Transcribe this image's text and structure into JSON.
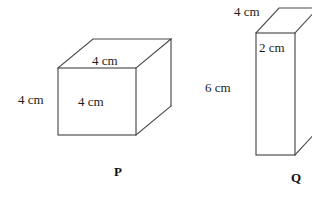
{
  "figure": {
    "background_color": "#ffffff",
    "line_color": "#4a4a4a",
    "text_color": "#1c1c1c",
    "shapes": [
      {
        "name": "P",
        "type": "cube",
        "labels": {
          "top_edge": "4 cm",
          "left_edge": "4 cm",
          "front_face": "4 cm"
        }
      },
      {
        "name": "Q",
        "type": "cuboid",
        "labels": {
          "top_edge": "4 cm",
          "depth_edge": "2 cm",
          "left_edge": "6 cm"
        }
      }
    ]
  },
  "labels": {
    "p_top": "4 cm",
    "p_left": "4 cm",
    "p_front": "4 cm",
    "p_name": "P",
    "q_top": "4 cm",
    "q_depth": "2 cm",
    "q_left": "6 cm",
    "q_name": "Q"
  }
}
